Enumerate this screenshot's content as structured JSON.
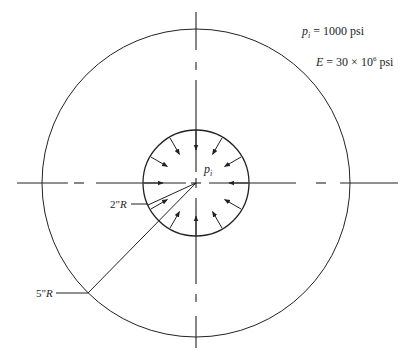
{
  "diagram": {
    "type": "thick-walled cylinder cross-section under internal pressure",
    "center": [
      196,
      183
    ],
    "outer_radius_px": 154,
    "inner_radius_px": 53,
    "line_color": "#222222",
    "labels": {
      "inner_radius": {
        "value": "2\"",
        "var": "R"
      },
      "outer_radius": {
        "value": "5\"",
        "var": "R"
      },
      "pressure_symbol": {
        "base": "p",
        "sub": "i"
      }
    },
    "givens": [
      {
        "base": "p",
        "sub": "i",
        "rest": " = 1000 psi"
      },
      {
        "base": "E",
        "rest1": " = 30 × 10",
        "sup": "6",
        "rest2": " psi"
      }
    ],
    "pressure_arrows_count": 12
  }
}
